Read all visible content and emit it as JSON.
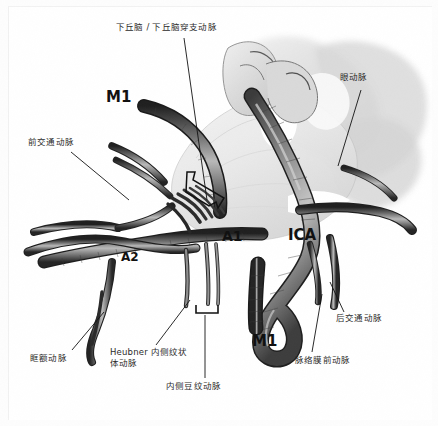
{
  "figure": {
    "background_color": "#ffffff",
    "ink_color": "#2b2b2b",
    "style": "grayscale anatomical pen-and-ink illustration"
  },
  "callouts": {
    "hypothalamic_perforators": "下丘脑 / 下丘脑穿支动脉",
    "anterior_communicating": "前交通动脉",
    "ophthalmic": "眼动脉",
    "posterior_communicating": "后交通动脉",
    "anterior_choroidal": "脉络膜前动脉",
    "orbitofrontal": "眶额动脉",
    "heubner_medial_striate": "Heubner 内侧纹状体动脉",
    "medial_lenticulostriate": "内侧豆纹动脉"
  },
  "segment_labels": {
    "m1_superior": "M1",
    "m1_inferior": "M1",
    "a1": "A1",
    "a2": "A2",
    "ica": "ICA"
  }
}
